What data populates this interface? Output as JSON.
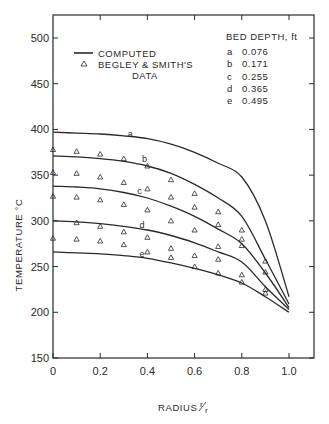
{
  "chart_data": {
    "type": "line",
    "title": "",
    "xlabel": "RADIUS r/r",
    "ylabel": "TEMPERATURE °C",
    "xlim": [
      0,
      1.1
    ],
    "ylim": [
      150,
      525
    ],
    "x_ticks": [
      "0",
      "0.2",
      "0.4",
      "0.6",
      "0.8",
      "1.0"
    ],
    "y_ticks": [
      "150",
      "200",
      "250",
      "300",
      "350",
      "400",
      "450",
      "500"
    ],
    "grid": false,
    "legend": {
      "position": "upper-left",
      "entries": [
        {
          "symbol": "line",
          "label": "COMPUTED"
        },
        {
          "symbol": "triangle",
          "label": "BEGLEY & SMITH'S DATA"
        }
      ]
    },
    "bed_depth_table": {
      "title": "BED DEPTH, ft",
      "rows": [
        {
          "key": "a",
          "value": "0.076"
        },
        {
          "key": "b",
          "value": "0.171"
        },
        {
          "key": "c",
          "value": "0.255"
        },
        {
          "key": "d",
          "value": "0.365"
        },
        {
          "key": "e",
          "value": "0.495"
        }
      ]
    },
    "x": [
      0,
      0.1,
      0.2,
      0.3,
      0.4,
      0.5,
      0.6,
      0.7,
      0.8,
      0.9,
      1.0
    ],
    "series": [
      {
        "name": "a (computed)",
        "tag": "a",
        "tag_at": [
          0.3,
          392
        ],
        "values": [
          397,
          396,
          395,
          393,
          390,
          384,
          375,
          363,
          348,
          300,
          217
        ]
      },
      {
        "name": "b (computed)",
        "tag": "b",
        "tag_at": [
          0.36,
          364
        ],
        "values": [
          371,
          370,
          368,
          365,
          360,
          352,
          340,
          325,
          305,
          258,
          209
        ]
      },
      {
        "name": "c (computed)",
        "tag": "c",
        "tag_at": [
          0.34,
          329
        ],
        "values": [
          338,
          337,
          335,
          331,
          325,
          316,
          305,
          291,
          275,
          243,
          205
        ]
      },
      {
        "name": "d (computed)",
        "tag": "d",
        "tag_at": [
          0.35,
          292
        ],
        "values": [
          300,
          299,
          297,
          294,
          290,
          284,
          276,
          266,
          255,
          228,
          203
        ]
      },
      {
        "name": "e (computed)",
        "tag": "e",
        "tag_at": [
          0.35,
          261
        ],
        "values": [
          266,
          265,
          264,
          262,
          259,
          254,
          248,
          241,
          232,
          217,
          200
        ]
      }
    ],
    "data_points": {
      "name": "BEGLEY & SMITH'S DATA",
      "marker": "triangle",
      "points": [
        [
          0,
          378
        ],
        [
          0,
          353
        ],
        [
          0,
          327
        ],
        [
          0,
          281
        ],
        [
          0.1,
          376
        ],
        [
          0.1,
          352
        ],
        [
          0.1,
          326
        ],
        [
          0.1,
          298
        ],
        [
          0.1,
          280
        ],
        [
          0.2,
          373
        ],
        [
          0.2,
          348
        ],
        [
          0.2,
          323
        ],
        [
          0.2,
          294
        ],
        [
          0.2,
          278
        ],
        [
          0.3,
          368
        ],
        [
          0.3,
          342
        ],
        [
          0.3,
          318
        ],
        [
          0.3,
          288
        ],
        [
          0.3,
          274
        ],
        [
          0.4,
          360
        ],
        [
          0.4,
          335
        ],
        [
          0.4,
          312
        ],
        [
          0.4,
          282
        ],
        [
          0.4,
          266
        ],
        [
          0.5,
          345
        ],
        [
          0.5,
          326
        ],
        [
          0.5,
          300
        ],
        [
          0.5,
          270
        ],
        [
          0.5,
          260
        ],
        [
          0.6,
          330
        ],
        [
          0.6,
          315
        ],
        [
          0.6,
          290
        ],
        [
          0.6,
          262
        ],
        [
          0.6,
          250
        ],
        [
          0.7,
          310
        ],
        [
          0.7,
          296
        ],
        [
          0.7,
          272
        ],
        [
          0.7,
          258
        ],
        [
          0.7,
          243
        ],
        [
          0.8,
          290
        ],
        [
          0.8,
          280
        ],
        [
          0.8,
          273
        ],
        [
          0.8,
          241
        ],
        [
          0.8,
          233
        ],
        [
          0.9,
          256
        ],
        [
          0.9,
          244
        ],
        [
          0.9,
          225
        ],
        [
          0.9,
          221
        ]
      ]
    }
  },
  "labels": {
    "y_axis": "TEMPERATURE °C",
    "x_axis_main": "RADIUS",
    "x_axis_frac_num": "r",
    "x_axis_frac_den": "r",
    "legend_computed": "COMPUTED",
    "legend_data_line1": "BEGLEY & SMITH'S",
    "legend_data_line2": "DATA",
    "bed_title": "BED DEPTH, ft"
  },
  "colors": {
    "ink": "#2a2a2a",
    "background": "#ffffff"
  }
}
